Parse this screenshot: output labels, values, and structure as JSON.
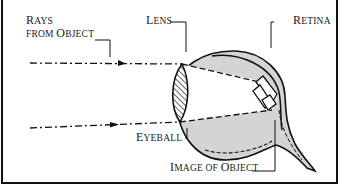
{
  "diagram": {
    "labels": {
      "rays": {
        "line1_cap": "R",
        "line1_rest": "AYS",
        "line2_a": "FROM ",
        "line2_cap": "O",
        "line2_rest": "BJECT"
      },
      "lens": {
        "cap": "L",
        "rest": "ENS"
      },
      "retina": {
        "cap": "R",
        "rest": "ETINA"
      },
      "eyeball": {
        "cap": "E",
        "rest": "YEBALL"
      },
      "image": {
        "cap1": "I",
        "rest1": "MAGE OF ",
        "cap2": "O",
        "rest2": "BJECT"
      }
    },
    "colors": {
      "ink": "#111111",
      "eye_fill": "#d4d4d4",
      "background": "#ffffff"
    }
  }
}
